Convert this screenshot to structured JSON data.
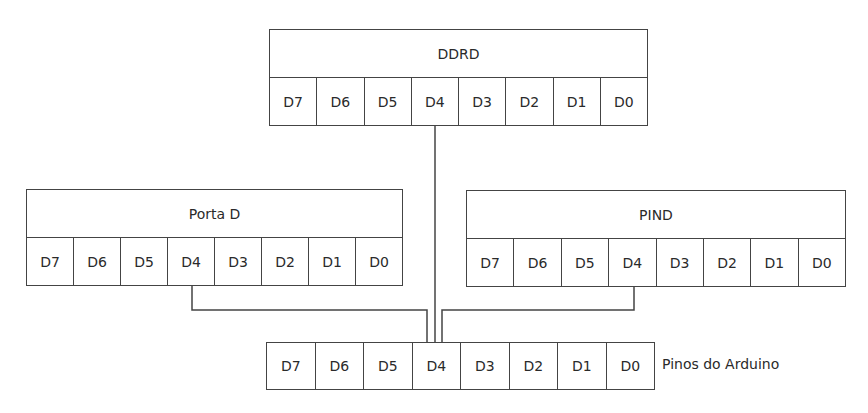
{
  "diagram": {
    "registers": [
      {
        "id": "ddrd",
        "title": "DDRD",
        "bits": [
          "D7",
          "D6",
          "D5",
          "D4",
          "D3",
          "D2",
          "D1",
          "D0"
        ]
      },
      {
        "id": "porta-d",
        "title": "Porta D",
        "bits": [
          "D7",
          "D6",
          "D5",
          "D4",
          "D3",
          "D2",
          "D1",
          "D0"
        ]
      },
      {
        "id": "pind",
        "title": "PIND",
        "bits": [
          "D7",
          "D6",
          "D5",
          "D4",
          "D3",
          "D2",
          "D1",
          "D0"
        ]
      }
    ],
    "pins": {
      "label": "Pinos do Arduino",
      "bits": [
        "D7",
        "D6",
        "D5",
        "D4",
        "D3",
        "D2",
        "D1",
        "D0"
      ]
    },
    "connections": [
      {
        "from": "DDRD.D4",
        "to": "Pinos do Arduino.D4"
      },
      {
        "from": "Porta D.D4",
        "to": "Pinos do Arduino.D4"
      },
      {
        "from": "PIND.D4",
        "to": "Pinos do Arduino.D4"
      }
    ],
    "line_color": "#444444"
  }
}
